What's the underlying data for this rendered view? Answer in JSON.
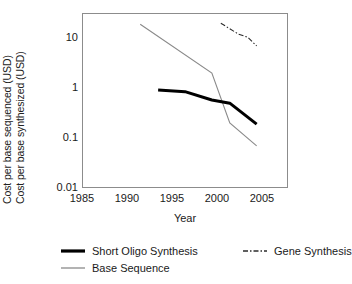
{
  "chart_data": {
    "type": "line",
    "title": "",
    "xlabel": "Year",
    "ylabel_lines": [
      "Cost per base sequenced (USD)",
      "Cost per base synthesized (USD)"
    ],
    "xlim": [
      1983.5,
      2006.5
    ],
    "xticks": [
      1985,
      1990,
      1995,
      2000,
      2005
    ],
    "xticklabels": [
      "1985",
      "1990",
      "1995",
      "2000",
      "2005"
    ],
    "yscale": "log",
    "ylim": [
      0.01,
      32
    ],
    "yticks": [
      10,
      1,
      0.1,
      0.01
    ],
    "yticklabels": [
      "10",
      "1",
      "0.1",
      "0.01"
    ],
    "grid": false,
    "legend_position": "below-axes",
    "series": [
      {
        "name": "Short Oligo Synthesis",
        "style": "solid-thick",
        "color": "#000000",
        "linewidth": 3.0,
        "x": [
          1992,
          1995,
          1998,
          2000,
          2003
        ],
        "y": [
          0.92,
          0.85,
          0.58,
          0.5,
          0.19
        ]
      },
      {
        "name": "Gene Synthesis",
        "style": "dash-dot",
        "color": "#2b2b2b",
        "linewidth": 1.1,
        "x": [
          1999,
          2001,
          2002,
          2003
        ],
        "y": [
          20,
          12,
          10.5,
          7
        ]
      },
      {
        "name": "Base Sequence",
        "style": "solid-thin",
        "color": "#8a8a8a",
        "linewidth": 1.1,
        "x": [
          1990,
          1998,
          2000,
          2003
        ],
        "y": [
          19,
          2.0,
          0.2,
          0.07
        ]
      }
    ]
  },
  "legend": {
    "items": [
      {
        "label": "Short Oligo Synthesis"
      },
      {
        "label": "Gene Synthesis"
      },
      {
        "label": "Base Sequence"
      }
    ]
  }
}
